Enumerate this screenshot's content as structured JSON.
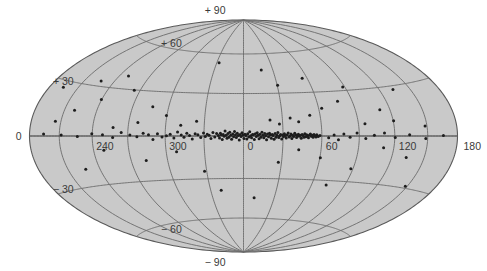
{
  "figure": {
    "name": "all-sky-galactic-distribution",
    "projection": "Aitoff-Hammer equal-area all-sky projection",
    "background_color": "#ffffff",
    "map_fill_color": "#c9c9c9",
    "grid_color": "#6b6b6b",
    "point_color": "#1d1d1d"
  },
  "labels": {
    "latitude": [
      {
        "text": "+ 90",
        "value": 90
      },
      {
        "text": "+ 60",
        "value": 60
      },
      {
        "text": "+ 30",
        "value": 30
      },
      {
        "text": "0",
        "value": 0
      },
      {
        "text": "− 30",
        "value": -30
      },
      {
        "text": "− 60",
        "value": -60
      },
      {
        "text": "− 90",
        "value": -90
      }
    ],
    "longitude": [
      {
        "text": "180",
        "value": 180
      },
      {
        "text": "120",
        "value": 120
      },
      {
        "text": "60",
        "value": 60
      },
      {
        "text": "0",
        "value": 0
      },
      {
        "text": "300",
        "value": 300
      },
      {
        "text": "240",
        "value": 240
      }
    ]
  },
  "chart_data": {
    "type": "scatter",
    "title": "",
    "subtitle": "",
    "xlabel": "Galactic longitude l (deg)",
    "ylabel": "Galactic latitude b (deg)",
    "xlim": [
      180,
      -180
    ],
    "ylim": [
      -90,
      90
    ],
    "grid": true,
    "legend": null,
    "projection": "aitoff",
    "x_tick_labels": [
      "180",
      "120",
      "60",
      "0",
      "300",
      "240"
    ],
    "x_tick_values": [
      180,
      120,
      60,
      0,
      300,
      240
    ],
    "y_tick_labels": [
      "+ 90",
      "+ 60",
      "+ 30",
      "0",
      "− 30",
      "− 60",
      "− 90"
    ],
    "y_tick_values": [
      90,
      60,
      30,
      0,
      -30,
      -60,
      -90
    ],
    "grid_longitude_step": 30,
    "grid_latitude_step": 30,
    "series": [
      {
        "name": "sources",
        "marker": "dot",
        "color": "#1d1d1d",
        "count": 186,
        "points": [
          [
            58.5,
            0.4
          ],
          [
            57.2,
            -0.3
          ],
          [
            56.1,
            0.8
          ],
          [
            55.4,
            -0.6
          ],
          [
            54.7,
            0.2
          ],
          [
            53.9,
            1.1
          ],
          [
            53.2,
            -0.9
          ],
          [
            52.5,
            0.5
          ],
          [
            51.8,
            -0.2
          ],
          [
            51.1,
            1.4
          ],
          [
            50.4,
            0.7
          ],
          [
            49.6,
            -1.2
          ],
          [
            48.9,
            0.1
          ],
          [
            48.2,
            0.9
          ],
          [
            47.5,
            -0.5
          ],
          [
            46.8,
            1.6
          ],
          [
            46.1,
            -0.8
          ],
          [
            45.4,
            0.3
          ],
          [
            44.7,
            1.0
          ],
          [
            44.0,
            -1.5
          ],
          [
            43.2,
            0.6
          ],
          [
            42.5,
            -0.1
          ],
          [
            41.8,
            1.2
          ],
          [
            41.1,
            0.4
          ],
          [
            40.4,
            -1.0
          ],
          [
            39.7,
            0.8
          ],
          [
            39.0,
            1.9
          ],
          [
            38.2,
            -0.4
          ],
          [
            37.5,
            0.5
          ],
          [
            36.8,
            -1.8
          ],
          [
            36.1,
            1.3
          ],
          [
            35.4,
            0.0
          ],
          [
            34.7,
            -0.7
          ],
          [
            34.0,
            2.1
          ],
          [
            33.2,
            0.9
          ],
          [
            32.5,
            -1.4
          ],
          [
            31.8,
            0.3
          ],
          [
            31.1,
            1.5
          ],
          [
            30.4,
            -0.6
          ],
          [
            29.7,
            0.7
          ],
          [
            29.0,
            -2.0
          ],
          [
            28.2,
            1.1
          ],
          [
            27.5,
            0.2
          ],
          [
            26.8,
            -1.1
          ],
          [
            26.1,
            2.4
          ],
          [
            25.4,
            0.6
          ],
          [
            24.7,
            -0.9
          ],
          [
            24.0,
            1.7
          ],
          [
            23.2,
            -2.3
          ],
          [
            22.5,
            0.4
          ],
          [
            21.8,
            1.0
          ],
          [
            21.1,
            -1.6
          ],
          [
            20.4,
            0.8
          ],
          [
            19.7,
            2.0
          ],
          [
            19.0,
            -0.5
          ],
          [
            18.2,
            1.4
          ],
          [
            17.5,
            -2.6
          ],
          [
            16.8,
            0.1
          ],
          [
            16.1,
            1.8
          ],
          [
            15.4,
            -1.2
          ],
          [
            14.7,
            0.6
          ],
          [
            14.0,
            2.7
          ],
          [
            13.2,
            -0.8
          ],
          [
            12.5,
            1.3
          ],
          [
            11.8,
            -1.9
          ],
          [
            11.1,
            0.5
          ],
          [
            10.4,
            2.2
          ],
          [
            9.7,
            -0.3
          ],
          [
            9.0,
            1.6
          ],
          [
            8.2,
            -2.4
          ],
          [
            7.5,
            0.9
          ],
          [
            6.8,
            1.1
          ],
          [
            6.1,
            -1.3
          ],
          [
            5.4,
            0.2
          ],
          [
            4.7,
            2.9
          ],
          [
            4.0,
            -0.7
          ],
          [
            3.2,
            1.5
          ],
          [
            2.5,
            -2.1
          ],
          [
            1.8,
            0.4
          ],
          [
            1.1,
            1.2
          ],
          [
            0.4,
            -1.7
          ],
          [
            -0.4,
            0.7
          ],
          [
            -1.1,
            2.3
          ],
          [
            -1.8,
            -0.4
          ],
          [
            -2.5,
            1.0
          ],
          [
            -3.2,
            -2.8
          ],
          [
            -4.0,
            0.3
          ],
          [
            -4.7,
            1.9
          ],
          [
            -5.4,
            -1.0
          ],
          [
            -6.1,
            0.8
          ],
          [
            -6.8,
            3.1
          ],
          [
            -7.5,
            -0.6
          ],
          [
            -8.2,
            1.4
          ],
          [
            -9.0,
            -2.2
          ],
          [
            -9.7,
            0.5
          ],
          [
            -10.4,
            2.6
          ],
          [
            -11.1,
            -0.9
          ],
          [
            -11.8,
            1.7
          ],
          [
            -12.5,
            -1.5
          ],
          [
            -13.2,
            0.6
          ],
          [
            -14.0,
            3.4
          ],
          [
            -14.7,
            -0.2
          ],
          [
            -15.4,
            1.1
          ],
          [
            -16.1,
            -2.5
          ],
          [
            -16.8,
            0.9
          ],
          [
            -17.5,
            2.0
          ],
          [
            -18.2,
            -1.4
          ],
          [
            -19.0,
            0.3
          ],
          [
            -20.4,
            1.8
          ],
          [
            -21.8,
            -0.7
          ],
          [
            -23.2,
            2.4
          ],
          [
            -24.7,
            -1.8
          ],
          [
            -26.1,
            0.6
          ],
          [
            -27.5,
            1.3
          ],
          [
            -29.0,
            -0.4
          ],
          [
            -30.4,
            2.1
          ],
          [
            -32.5,
            -1.1
          ],
          [
            -34.7,
            0.8
          ],
          [
            -36.8,
            1.6
          ],
          [
            -39.0,
            -2.0
          ],
          [
            -41.1,
            0.4
          ],
          [
            -43.2,
            1.9
          ],
          [
            -45.4,
            -0.9
          ],
          [
            -47.5,
            0.7
          ],
          [
            -50.4,
            2.7
          ],
          [
            -53.2,
            -1.3
          ],
          [
            -56.1,
            1.2
          ],
          [
            -59.0,
            0.2
          ],
          [
            -62.5,
            -0.6
          ],
          [
            -66.1,
            1.5
          ],
          [
            -69.7,
            -2.3
          ],
          [
            -73.2,
            0.9
          ],
          [
            -77.5,
            1.8
          ],
          [
            -82.5,
            -0.5
          ],
          [
            -88.2,
            0.6
          ],
          [
            -95.4,
            2.2
          ],
          [
            -102.5,
            -1.0
          ],
          [
            -111.1,
            0.8
          ],
          [
            -120.4,
            1.4
          ],
          [
            -133.2,
            -0.3
          ],
          [
            -148.2,
            0.5
          ],
          [
            -165.4,
            1.0
          ],
          [
            65.4,
            -1.1
          ],
          [
            69.7,
            0.6
          ],
          [
            73.2,
            -2.5
          ],
          [
            77.5,
            1.4
          ],
          [
            82.5,
            -0.8
          ],
          [
            88.2,
            2.0
          ],
          [
            95.4,
            -1.6
          ],
          [
            102.5,
            0.4
          ],
          [
            111.1,
            1.8
          ],
          [
            120.4,
            -0.9
          ],
          [
            133.2,
            0.7
          ],
          [
            148.2,
            -1.4
          ],
          [
            165.4,
            0.3
          ],
          [
            36.1,
            12.5
          ],
          [
            42.5,
            9.8
          ],
          [
            27.5,
            8.4
          ],
          [
            51.8,
            14.2
          ],
          [
            20.4,
            11.1
          ],
          [
            62.5,
            18.7
          ],
          [
            95.4,
            7.9
          ],
          [
            120.4,
            9.3
          ],
          [
            148.2,
            5.6
          ],
          [
            111.1,
            16.4
          ],
          [
            77.5,
            23.1
          ],
          [
            133.2,
            27.8
          ],
          [
            88.2,
            32.4
          ],
          [
            55.4,
            40.2
          ],
          [
            30.4,
            35.7
          ],
          [
            -36.1,
            10.2
          ],
          [
            -48.2,
            7.4
          ],
          [
            -60.4,
            13.8
          ],
          [
            -82.5,
            8.9
          ],
          [
            -102.5,
            5.3
          ],
          [
            -73.2,
            19.6
          ],
          [
            -120.4,
            22.4
          ],
          [
            -95.4,
            29.7
          ],
          [
            -140.4,
            14.8
          ],
          [
            -155.4,
            8.1
          ],
          [
            -111.1,
            38.5
          ],
          [
            -133.2,
            33.2
          ],
          [
            -165.4,
            26.4
          ],
          [
            18.2,
            47.3
          ],
          [
            -27.5,
            52.8
          ],
          [
            42.5,
            -9.4
          ],
          [
            111.1,
            -7.2
          ],
          [
            133.2,
            -12.6
          ],
          [
            60.4,
            -14.8
          ],
          [
            27.5,
            -18.3
          ],
          [
            -51.8,
            -10.7
          ],
          [
            -77.5,
            -16.2
          ],
          [
            -111.1,
            -8.9
          ],
          [
            -31.8,
            -24.6
          ],
          [
            88.2,
            -21.4
          ],
          [
            148.2,
            -28.9
          ],
          [
            -20.4,
            -38.4
          ],
          [
            73.2,
            -33.1
          ],
          [
            -133.2,
            -19.7
          ],
          [
            10.4,
            -44.2
          ]
        ]
      }
    ]
  }
}
